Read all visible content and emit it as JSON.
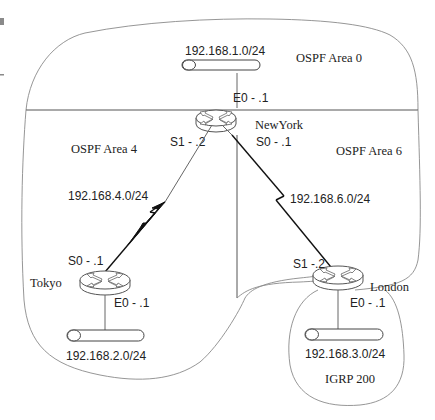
{
  "diagram": {
    "areas": {
      "area0": {
        "label": "OSPF Area 0"
      },
      "area4": {
        "label": "OSPF Area 4"
      },
      "area6": {
        "label": "OSPF Area 6"
      },
      "igrp": {
        "label": "IGRP 200"
      }
    },
    "routers": {
      "newyork": {
        "name": "NewYork",
        "e0": "E0 - .1",
        "s1": "S1 - .2",
        "s0": "S0 - .1"
      },
      "tokyo": {
        "name": "Tokyo",
        "s0": "S0 - .1",
        "e0": "E0 - .1"
      },
      "london": {
        "name": "London",
        "s1": "S1 -.2",
        "e0": "E0 - .1"
      }
    },
    "networks": {
      "lan_newyork": "192.168.1.0/24",
      "lan_tokyo": "192.168.2.0/24",
      "lan_london": "192.168.3.0/24",
      "wan_newyork_tokyo": "192.168.4.0/24",
      "wan_newyork_london": "192.168.6.0/24"
    }
  }
}
